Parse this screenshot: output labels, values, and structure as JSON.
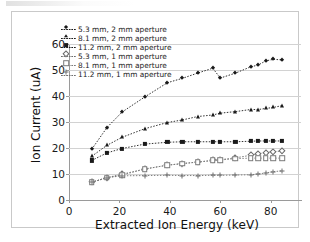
{
  "figure": {
    "background_color": "#ffffff",
    "border_color": "#c9c9c9"
  },
  "chart_data": {
    "type": "line",
    "title": "",
    "xlabel": "Extracted Ion Energy (keV)",
    "ylabel": "Ion Current (uA)",
    "xlim": [
      0,
      92
    ],
    "ylim": [
      0,
      60
    ],
    "xticks": [
      0,
      20,
      40,
      60,
      80
    ],
    "yticks": [
      0,
      10,
      20,
      30,
      40,
      50,
      60
    ],
    "grid": "horizontal",
    "grid_color": "#d2d2d2",
    "legend_position": "upper-left-inside",
    "series": [
      {
        "name": "5.3 mm, 2 mm aperture",
        "marker": "diamond-filled",
        "color": "#1a1a1a",
        "linestyle": "dotted",
        "x": [
          9.0,
          15.0,
          21.0,
          30.0,
          39.0,
          45.0,
          51.0,
          57.0,
          60.0,
          66.0,
          72.0,
          75.0,
          78.0,
          81.0,
          84.5
        ],
        "y": [
          19.5,
          27.8,
          33.8,
          39.6,
          45.1,
          46.8,
          48.8,
          50.7,
          46.9,
          48.8,
          51.2,
          51.9,
          53.5,
          54.1,
          53.9
        ]
      },
      {
        "name": "8.1 mm, 2 mm aperture",
        "marker": "triangle-filled",
        "color": "#1a1a1a",
        "linestyle": "dotted",
        "x": [
          9.0,
          15.0,
          21.0,
          30.0,
          39.0,
          45.0,
          51.0,
          57.0,
          60.0,
          66.0,
          72.0,
          75.0,
          78.0,
          81.0,
          84.5
        ],
        "y": [
          16.8,
          21.0,
          24.1,
          27.4,
          29.8,
          30.8,
          32.1,
          32.7,
          33.4,
          34.0,
          34.8,
          34.8,
          35.2,
          35.6,
          36.3
        ]
      },
      {
        "name": "11.2 mm, 2 mm aperture",
        "marker": "square-filled",
        "color": "#1a1a1a",
        "linestyle": "dotted",
        "x": [
          9.0,
          15.0,
          21.0,
          30.0,
          39.0,
          45.0,
          51.0,
          57.0,
          60.0,
          66.0,
          72.0,
          75.0,
          78.0,
          81.0,
          84.5
        ],
        "y": [
          15.2,
          18.1,
          19.8,
          21.5,
          22.2,
          22.4,
          22.4,
          22.4,
          22.4,
          22.4,
          22.6,
          22.7,
          22.7,
          22.7,
          22.7
        ]
      },
      {
        "name": "5.3 mm, 1 mm aperture",
        "marker": "diamond-open",
        "color": "#6a6a6a",
        "linestyle": "dotted",
        "x": [
          9.0,
          15.0,
          21.0,
          30.0,
          39.0,
          45.0,
          51.0,
          57.0,
          60.0,
          66.0,
          72.0,
          75.0,
          78.0,
          81.0,
          84.5
        ],
        "y": [
          6.8,
          8.6,
          9.9,
          11.9,
          13.4,
          14.0,
          14.6,
          15.2,
          15.5,
          16.2,
          17.2,
          17.8,
          18.2,
          18.6,
          18.8
        ]
      },
      {
        "name": "8.1 mm, 1 mm aperture",
        "marker": "square-open",
        "color": "#7a7a7a",
        "linestyle": "dotted",
        "x": [
          9.0,
          15.0,
          21.0,
          30.0,
          39.0,
          45.0,
          51.0,
          57.0,
          60.0,
          66.0,
          72.0,
          75.0,
          78.0,
          81.0,
          84.5
        ],
        "y": [
          6.8,
          8.6,
          9.6,
          11.9,
          13.4,
          14.0,
          14.6,
          15.2,
          15.4,
          15.9,
          16.1,
          16.1,
          16.1,
          16.1,
          16.1
        ]
      },
      {
        "name": "11.2 mm, 1 mm aperture",
        "marker": "plus",
        "color": "#6f6f6f",
        "linestyle": "dotted",
        "x": [
          9.0,
          15.0,
          21.0,
          30.0,
          39.0,
          45.0,
          51.0,
          57.0,
          60.0,
          66.0,
          72.0,
          75.0,
          78.0,
          81.0,
          84.5
        ],
        "y": [
          6.8,
          8.6,
          9.3,
          9.4,
          9.5,
          9.4,
          9.4,
          9.5,
          9.5,
          9.6,
          9.7,
          10.0,
          10.4,
          10.9,
          11.2
        ]
      }
    ]
  }
}
